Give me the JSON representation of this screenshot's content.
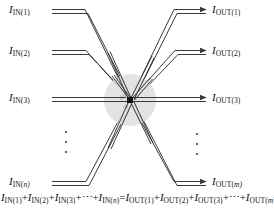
{
  "figure": {
    "accent_color": "#3a3a3a",
    "node_color": "#111111",
    "halo_color": "#dcdcdc",
    "background": "#ffffff"
  },
  "inputs": [
    {
      "id": "in-1",
      "symbol": "I",
      "sub": "IN(1)",
      "sub_italic_tail": ""
    },
    {
      "id": "in-2",
      "symbol": "I",
      "sub": "IN(2)",
      "sub_italic_tail": ""
    },
    {
      "id": "in-3",
      "symbol": "I",
      "sub": "IN(3)",
      "sub_italic_tail": ""
    },
    {
      "id": "in-n",
      "symbol": "I",
      "sub": "IN(",
      "sub_italic_tail": "n)"
    }
  ],
  "outputs": [
    {
      "id": "out-1",
      "symbol": "I",
      "sub": "OUT(1)",
      "sub_italic_tail": ""
    },
    {
      "id": "out-2",
      "symbol": "I",
      "sub": "OUT(2)",
      "sub_italic_tail": ""
    },
    {
      "id": "out-3",
      "symbol": "I",
      "sub": "OUT(3)",
      "sub_italic_tail": ""
    },
    {
      "id": "out-m",
      "symbol": "I",
      "sub": "OUT(",
      "sub_italic_tail": "m)"
    }
  ],
  "labels": {
    "in_1": "IIN(1)",
    "in_2": "IIN(2)",
    "in_3": "IIN(3)",
    "in_n": "IIN(n)",
    "out_1": "IOUT(1)",
    "out_2": "IOUT(2)",
    "out_3": "IOUT(3)",
    "out_m": "IOUT(m)"
  },
  "ellipsis": {
    "left": "⋮",
    "right": "⋮",
    "dot_count": 3
  },
  "equation": {
    "text": "IIN(1)+IIN(2)+IIN(3)+⋯+IIN(n)=IOUT(1)+IOUT(2)+IOUT(3)+⋯+IOUT(m)",
    "left_terms": [
      "IIN(1)",
      "IIN(2)",
      "IIN(3)",
      "⋯",
      "IIN(n)"
    ],
    "right_terms": [
      "IOUT(1)",
      "IOUT(2)",
      "IOUT(3)",
      "⋯",
      "IOUT(m)"
    ],
    "relation": "="
  },
  "node": {
    "label": "junction-node",
    "x": 130,
    "y": 100
  }
}
